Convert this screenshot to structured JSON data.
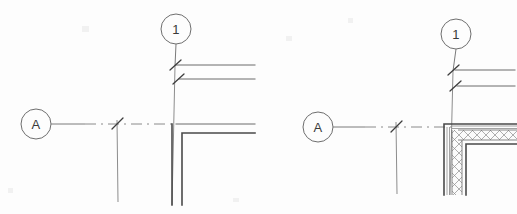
{
  "document": {
    "title": "Wall Corner Grid Intersection Detail",
    "background_color": "#fdfdfd",
    "line_color": "#4a4a4a",
    "grid_line_color": "#8a8a8a",
    "width": 517,
    "height": 214
  },
  "details": [
    {
      "id": "detail-left",
      "name": "Unfilled Wall Corner Detail",
      "grid_bubbles": [
        {
          "id": "bubble-1-left",
          "label": "1",
          "axis": "vertical",
          "center_x": 176,
          "center_y": 29,
          "radius": 15
        },
        {
          "id": "bubble-a-left",
          "label": "A",
          "axis": "horizontal",
          "center_x": 36,
          "center_y": 124,
          "radius": 15
        }
      ],
      "tick_marks": [
        {
          "id": "tick-1-upper",
          "x": 175,
          "y": 65
        },
        {
          "id": "tick-1-lower",
          "x": 178,
          "y": 79
        },
        {
          "id": "tick-a-grid",
          "x": 117,
          "y": 124
        }
      ],
      "wall_type": "outline",
      "hatched": false
    },
    {
      "id": "detail-right",
      "name": "Hatched Wall Corner Detail",
      "grid_bubbles": [
        {
          "id": "bubble-1-right",
          "label": "1",
          "axis": "vertical",
          "center_x": 456,
          "center_y": 34,
          "radius": 15
        },
        {
          "id": "bubble-a-right",
          "label": "A",
          "axis": "horizontal",
          "center_x": 318,
          "center_y": 127,
          "radius": 15
        }
      ],
      "tick_marks": [
        {
          "id": "tick-1-upper-r",
          "x": 452,
          "y": 70
        },
        {
          "id": "tick-1-lower-r",
          "x": 454,
          "y": 86
        },
        {
          "id": "tick-a-grid-r",
          "x": 396,
          "y": 127
        }
      ],
      "wall_type": "hatched-assembly",
      "hatched": true,
      "hatch_pattern": "cross-hatch"
    }
  ],
  "legend": {
    "bubble_vertical_label": "1",
    "bubble_horizontal_label": "A"
  }
}
